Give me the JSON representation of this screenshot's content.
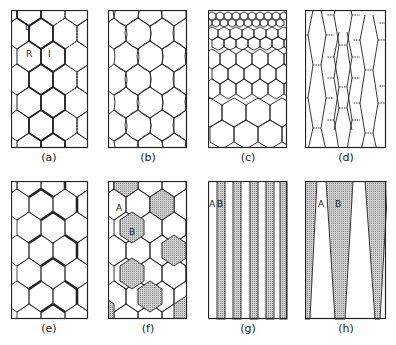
{
  "figure": {
    "panels": [
      {
        "id": "a",
        "caption": "(a)",
        "description": "Regular hexagonal grain structure with mixed solid, thick and dotted boundaries",
        "labels": [
          "L",
          "R",
          "I"
        ]
      },
      {
        "id": "b",
        "caption": "(b)",
        "description": "Hexagonal grains with serrated (wavy) boundaries",
        "labels": []
      },
      {
        "id": "c",
        "caption": "(c)",
        "description": "Grain size gradient: small grains at top grading to large grains at bottom",
        "labels": []
      },
      {
        "id": "d",
        "caption": "(d)",
        "description": "Vertically elongated (columnar) hexagonal grains with dotted short boundaries",
        "labels": []
      },
      {
        "id": "e",
        "caption": "(e)",
        "description": "Hexagonal grains with selected thick boundaries",
        "labels": []
      },
      {
        "id": "f",
        "caption": "(f)",
        "description": "Hexagonal grains of two phases; shaded grains B among unshaded grains A",
        "labels": [
          "A",
          "B"
        ]
      },
      {
        "id": "g",
        "caption": "(g)",
        "description": "Alternating vertical lamellae: white A and stippled B bands",
        "labels": [
          "A",
          "B"
        ]
      },
      {
        "id": "h",
        "caption": "(h)",
        "description": "Tapered wedge-shaped stippled B regions alternating with white A regions",
        "labels": [
          "A",
          "B"
        ]
      }
    ],
    "colors": {
      "line": "#222222",
      "shade": "#b8b8b8",
      "background": "#ffffff"
    }
  }
}
